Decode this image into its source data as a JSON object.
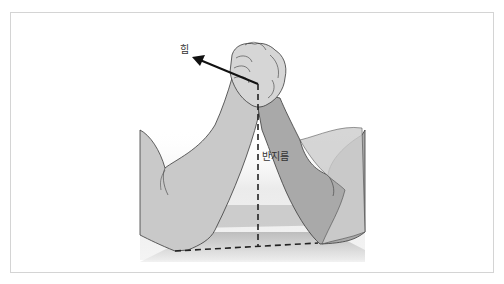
{
  "diagram": {
    "labels": {
      "force": "힘",
      "radius": "반지름"
    },
    "colors": {
      "frame_border": "#d4d4d4",
      "left_arm_fill": "#c9c9c9",
      "right_arm_fill": "#a9a9a9",
      "hand_fill": "#d6d6d6",
      "outline": "#3a3a3a",
      "table_shadow": "#b8b8b8",
      "arrow": "#111111",
      "dashed_line": "#222222"
    }
  }
}
